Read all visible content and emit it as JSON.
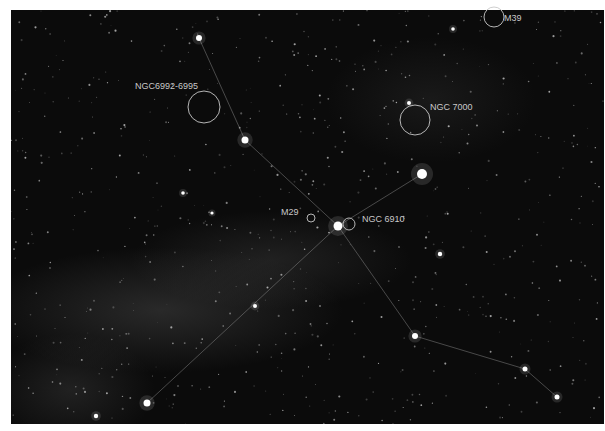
{
  "image": {
    "subject": "Cygnus constellation star field with Milky Way",
    "frame_color": "#ffffff",
    "sky_color": "#0b0b0b",
    "annotation_color": "#c8c8c8"
  },
  "annotations": [
    {
      "id": "ngc6992",
      "label": "NGC6992-6995",
      "cx": 204,
      "cy": 107,
      "r": 16,
      "lx": 135,
      "ly": 89
    },
    {
      "id": "ngc7000",
      "label": "NGC 7000",
      "cx": 415,
      "cy": 120,
      "r": 15,
      "lx": 430,
      "ly": 110
    },
    {
      "id": "m39",
      "label": "M39",
      "cx": 494,
      "cy": 17,
      "r": 10,
      "lx": 504,
      "ly": 21
    },
    {
      "id": "m29",
      "label": "M29",
      "cx": 311,
      "cy": 218,
      "r": 4,
      "lx": 281,
      "ly": 215
    },
    {
      "id": "ngc6910",
      "label": "NGC 6910",
      "cx": 349,
      "cy": 224,
      "r": 6,
      "lx": 362,
      "ly": 222
    }
  ],
  "constellation_lines": [
    [
      [
        199,
        38
      ],
      [
        245,
        140
      ],
      [
        338,
        226
      ],
      [
        415,
        336
      ],
      [
        525,
        369
      ],
      [
        557,
        397
      ]
    ],
    [
      [
        147,
        403
      ],
      [
        338,
        226
      ],
      [
        422,
        174
      ]
    ]
  ],
  "bright_stars": [
    {
      "x": 338,
      "y": 226,
      "r": 4.5
    },
    {
      "x": 422,
      "y": 174,
      "r": 5
    },
    {
      "x": 245,
      "y": 140,
      "r": 3.5
    },
    {
      "x": 199,
      "y": 38,
      "r": 3
    },
    {
      "x": 147,
      "y": 403,
      "r": 3.5
    },
    {
      "x": 415,
      "y": 336,
      "r": 3
    },
    {
      "x": 525,
      "y": 369,
      "r": 2.5
    },
    {
      "x": 557,
      "y": 397,
      "r": 2.5
    },
    {
      "x": 440,
      "y": 254,
      "r": 2.2
    },
    {
      "x": 255,
      "y": 306,
      "r": 2
    },
    {
      "x": 409,
      "y": 103,
      "r": 2
    },
    {
      "x": 96,
      "y": 416,
      "r": 2.2
    },
    {
      "x": 183,
      "y": 193,
      "r": 1.8
    },
    {
      "x": 212,
      "y": 213,
      "r": 1.6
    },
    {
      "x": 453,
      "y": 29,
      "r": 1.8
    }
  ]
}
